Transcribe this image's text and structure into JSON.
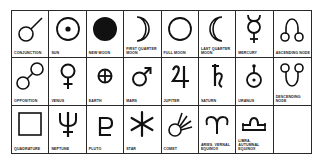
{
  "diagram": {
    "title": "",
    "rows": 3,
    "columns": 8,
    "cells": [
      {
        "label": "Conjunction",
        "icon": "conjunction-icon"
      },
      {
        "label": "Sun",
        "icon": "sun-icon"
      },
      {
        "label": "New Moon",
        "icon": "new-moon-icon"
      },
      {
        "label": "First Quarter Moon",
        "icon": "first-quarter-moon-icon"
      },
      {
        "label": "Full Moon",
        "icon": "full-moon-icon"
      },
      {
        "label": "Last Quarter Moon",
        "icon": "last-quarter-moon-icon"
      },
      {
        "label": "Mercury",
        "icon": "mercury-icon"
      },
      {
        "label": "Ascending Node",
        "icon": "ascending-node-icon"
      },
      {
        "label": "Opposition",
        "icon": "opposition-icon"
      },
      {
        "label": "Venus",
        "icon": "venus-icon"
      },
      {
        "label": "Earth",
        "icon": "earth-icon"
      },
      {
        "label": "Mars",
        "icon": "mars-icon"
      },
      {
        "label": "Jupiter",
        "icon": "jupiter-icon"
      },
      {
        "label": "Saturn",
        "icon": "saturn-icon"
      },
      {
        "label": "Uranus",
        "icon": "uranus-icon"
      },
      {
        "label": "Descending Node",
        "icon": "descending-node-icon"
      },
      {
        "label": "Quadrature",
        "icon": "quadrature-icon"
      },
      {
        "label": "Neptune",
        "icon": "neptune-icon"
      },
      {
        "label": "Pluto",
        "icon": "pluto-icon"
      },
      {
        "label": "Star",
        "icon": "star-icon"
      },
      {
        "label": "Comet",
        "icon": "comet-icon"
      },
      {
        "label": "Aries, Vernal Equinox",
        "icon": "aries-icon"
      },
      {
        "label": "Libra, Autumnal Equinox",
        "icon": "libra-icon"
      },
      {
        "label": "",
        "icon": ""
      }
    ]
  },
  "colors": {
    "ink": "#111111",
    "grid": "#2a2a2a",
    "background": "#ffffff"
  }
}
